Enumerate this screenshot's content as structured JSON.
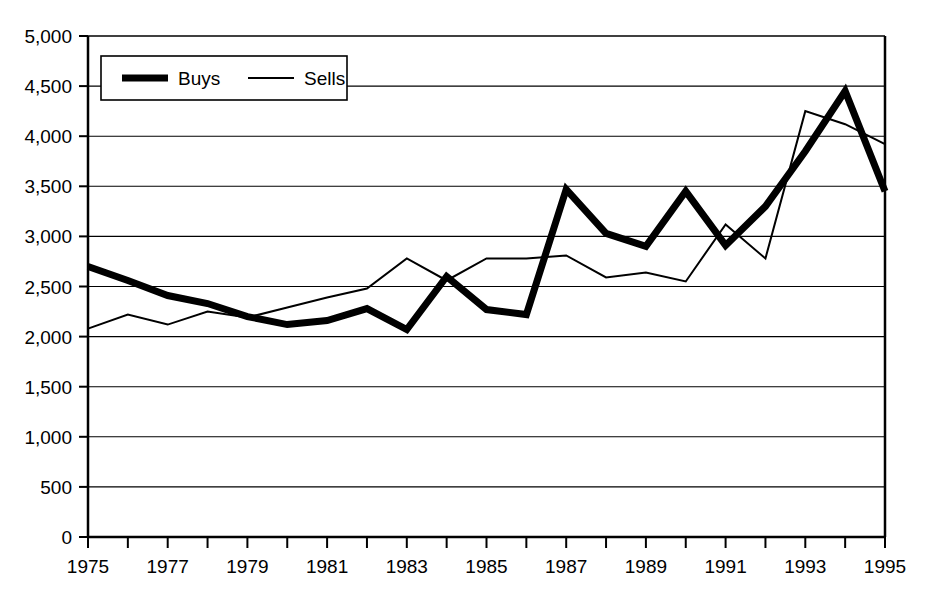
{
  "chart_data": {
    "type": "line",
    "title": "",
    "subtitle": "",
    "xlabel": "",
    "ylabel": "",
    "xlim": [
      1975,
      1995
    ],
    "ylim": [
      0,
      5000
    ],
    "grid": true,
    "legend_position": "top-left",
    "y_ticks": [
      0,
      500,
      1000,
      1500,
      2000,
      2500,
      3000,
      3500,
      4000,
      4500,
      5000
    ],
    "y_tick_labels": [
      "0",
      "500",
      "1,000",
      "1,500",
      "2,000",
      "2,500",
      "3,000",
      "3,500",
      "4,000",
      "4,500",
      "5,000"
    ],
    "x": [
      1975,
      1976,
      1977,
      1978,
      1979,
      1980,
      1981,
      1982,
      1983,
      1984,
      1985,
      1986,
      1987,
      1988,
      1989,
      1990,
      1991,
      1992,
      1993,
      1994,
      1995
    ],
    "x_tick_labels": [
      "1975",
      "1977",
      "1979",
      "1981",
      "1983",
      "1985",
      "1987",
      "1989",
      "1991",
      "1993",
      "1995"
    ],
    "x_ticks_labeled": [
      1975,
      1977,
      1979,
      1981,
      1983,
      1985,
      1987,
      1989,
      1991,
      1993,
      1995
    ],
    "series": [
      {
        "name": "Buys",
        "style": "thick",
        "color": "#000000",
        "width": 7,
        "values": [
          2700,
          2560,
          2410,
          2330,
          2200,
          2120,
          2160,
          2280,
          2070,
          2600,
          2270,
          2220,
          3470,
          3030,
          2900,
          3450,
          2910,
          3300,
          3850,
          4450,
          3450
        ]
      },
      {
        "name": "Sells",
        "style": "thin",
        "color": "#000000",
        "width": 2,
        "values": [
          2080,
          2220,
          2120,
          2250,
          2190,
          2290,
          2390,
          2480,
          2780,
          2560,
          2780,
          2780,
          2810,
          2590,
          2640,
          2550,
          3120,
          2780,
          4250,
          4120,
          3920
        ]
      }
    ]
  },
  "legend": {
    "entries": [
      {
        "label": "Buys"
      },
      {
        "label": "Sells"
      }
    ]
  }
}
